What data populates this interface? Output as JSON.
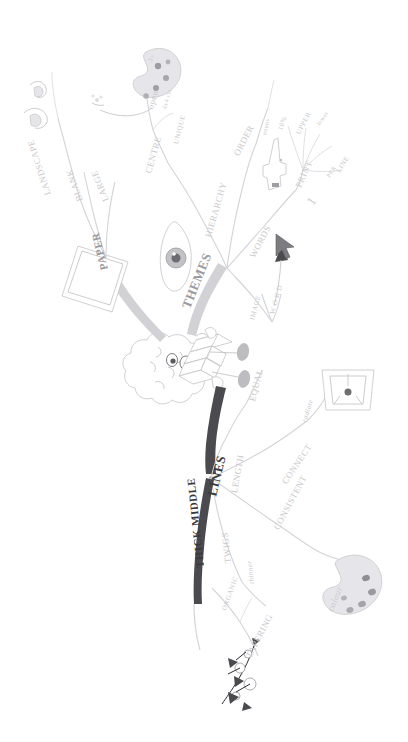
{
  "diagram": {
    "type": "mind-map",
    "orientation": "rotated-90",
    "center_label": "Mind Map Laws",
    "palette": {
      "faint": "#c9c9cc",
      "mid": "#9a9a9f",
      "dark": "#3a3a3e",
      "branch": "#d7d7da",
      "background": "#ffffff"
    }
  },
  "branches": {
    "paper": {
      "label": "PAPER",
      "children": [
        {
          "label": "LANDSCAPE"
        },
        {
          "label": "BLANK"
        },
        {
          "label": "LARGE"
        }
      ]
    },
    "themes": {
      "label": "THEMES",
      "children": [
        {
          "label": "CENTRE",
          "children": [
            {
              "label": "open"
            },
            {
              "label": "4x4 cm"
            },
            {
              "label": "3+"
            },
            {
              "label": "UNIQUE"
            }
          ]
        },
        {
          "label": "HIERARCHY"
        },
        {
          "label": "ORDER"
        },
        {
          "label": "WORDS",
          "children": [
            {
              "label": "nouns"
            },
            {
              "label": "10%"
            },
            {
              "label": "PRINT"
            },
            {
              "label": "UPPER"
            },
            {
              "label": "lower"
            },
            {
              "label": "1"
            },
            {
              "label": "PER"
            },
            {
              "label": "LINE"
            }
          ]
        },
        {
          "label": "IMAGE"
        },
        {
          "label": "W O R D"
        },
        {
          "label": "EQUAL"
        }
      ]
    },
    "lines": {
      "label": "LINES",
      "children": [
        {
          "label": "LENGTH"
        },
        {
          "label": "CONNECT",
          "children": [
            {
              "label": "radiate"
            }
          ]
        },
        {
          "label": "CONSISTENT",
          "children": [
            {
              "label": "colour"
            }
          ]
        },
        {
          "label": "TWIGS",
          "children": [
            {
              "label": "thinner"
            }
          ]
        },
        {
          "label": "THICK MIDDLE"
        },
        {
          "label": "ORGANIC"
        },
        {
          "label": "TAPERING"
        }
      ]
    }
  },
  "labels": {
    "landscape": "LANDSCAPE",
    "blank": "BLANK",
    "large": "LARGE",
    "paper": "PAPER",
    "themes": "THEMES",
    "centre": "CENTRE",
    "open": "open",
    "size": "4x4 cm",
    "three_plus": "3+",
    "unique": "UNIQUE",
    "hierarchy": "HIERARCHY",
    "order": "ORDER",
    "words": "WORDS",
    "nouns": "nouns",
    "ten_percent": "10%",
    "print": "PRINT",
    "upper": "UPPER",
    "lower": "lower",
    "one": "1",
    "per": "PER",
    "line": "LINE",
    "image": "IMAGE",
    "word_spaced": "W O R D",
    "equal": "EQUAL",
    "lines": "LINES",
    "length": "LENGTH",
    "connect": "CONNECT",
    "radiate": "radiate",
    "consistent": "CONSISTENT",
    "colour": "colour",
    "twigs": "TWIGS",
    "thinner": "thinner",
    "thick_middle": "THICK MIDDLE",
    "organic": "ORGANIC",
    "tapering": "TAPERING"
  },
  "icons": {
    "paper_sheet": "paper-sheet-icon",
    "palette_top": "paint-palette-icon",
    "eye": "eye-icon",
    "hand_point": "pointing-hand-icon",
    "brain_character": "brain-character-icon",
    "cup": "cup-icon",
    "palette_bottom": "paint-palette-icon",
    "flower": "flower-branch-icon",
    "arrow": "arrow-icon",
    "cursor": "mouse-cursor-icon"
  }
}
